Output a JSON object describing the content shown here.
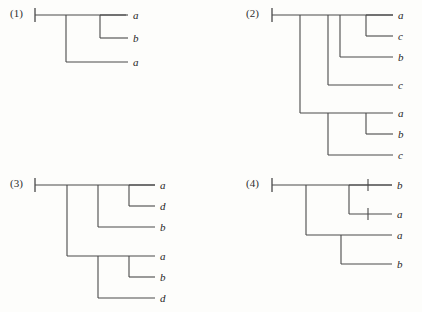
{
  "figure": {
    "line_color": "#4a4a4a",
    "label_color": "#262626",
    "background_color": "#fdfdfb"
  },
  "panels": [
    {
      "id": "tree-1",
      "label": "(1)",
      "leaf_labels": [
        "a",
        "b",
        "a"
      ],
      "newick": "((a,b),a);",
      "leaf_count": 3
    },
    {
      "id": "tree-2",
      "label": "(2)",
      "leaf_labels": [
        "a",
        "c",
        "b",
        "c",
        "a",
        "b",
        "c"
      ],
      "newick": "((((a,c),b),c),((a,b),c));",
      "leaf_count": 7
    },
    {
      "id": "tree-3",
      "label": "(3)",
      "leaf_labels": [
        "a",
        "d",
        "b",
        "a",
        "b",
        "d"
      ],
      "newick": "(((a,d),b),((a,b),d));",
      "leaf_count": 6
    },
    {
      "id": "tree-4",
      "label": "(4)",
      "leaf_labels": [
        "b",
        "a",
        "a",
        "b"
      ],
      "newick": "((b,a),(a,b));",
      "leaf_count": 4,
      "has_branch_ticks": true
    }
  ]
}
